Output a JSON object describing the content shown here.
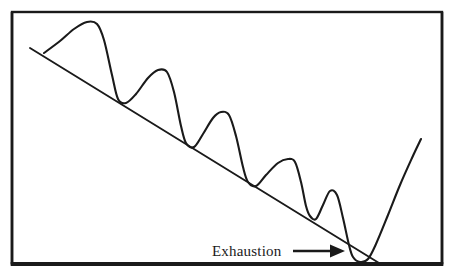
{
  "figure": {
    "background_color": "#ffffff",
    "ink_color": "#1a1a1a"
  },
  "frame": {
    "name": "chart-border-frame",
    "x": 12,
    "y": 12,
    "width": 430,
    "height": 252,
    "stroke_color": "#1a1a1a",
    "top_stroke_width": 2.4,
    "left_stroke_width": 2.6,
    "right_stroke_width": 2.6,
    "bottom_stroke_width": 4.2
  },
  "annotation": {
    "label": "Exhaustion",
    "label_x": 212,
    "label_baseline_y": 256,
    "font_size": 15,
    "arrow": {
      "name": "exhaustion-arrow",
      "shaft_start_x": 293,
      "shaft_end_x": 332,
      "y": 251,
      "head_tip_x": 345,
      "head_half_height": 6.5,
      "color": "#1a1a1a"
    }
  },
  "chart_data": {
    "type": "line",
    "subtitle": "",
    "xlabel": "",
    "ylabel": "",
    "grid": false,
    "legend_position": "none",
    "xlim": [
      12,
      442
    ],
    "ylim": [
      12,
      264
    ],
    "annotations": [
      {
        "text": "Exhaustion",
        "points_to_x": 352,
        "points_to_y": 256,
        "arrow": true,
        "arrow_direction": "right"
      }
    ],
    "series": [
      {
        "name": "price-curve",
        "type": "line",
        "stroke_color": "#1a1a1a",
        "stroke_width": 2.1,
        "smooth": true,
        "comment": "Descending series of five rounded peaks with progressively lower highs and lows, an exhaustion double-bottom, then a sharp rally.",
        "points": [
          {
            "x": 44,
            "y": 53,
            "role": "start"
          },
          {
            "x": 60,
            "y": 41,
            "role": "rise"
          },
          {
            "x": 74,
            "y": 29,
            "role": "rise"
          },
          {
            "x": 87,
            "y": 22,
            "role": "peak-1"
          },
          {
            "x": 97,
            "y": 24,
            "role": "peak-1-shoulder"
          },
          {
            "x": 104,
            "y": 40,
            "role": "decline"
          },
          {
            "x": 112,
            "y": 75,
            "role": "decline"
          },
          {
            "x": 118,
            "y": 99,
            "role": "trough-1"
          },
          {
            "x": 126,
            "y": 103,
            "role": "trough-1-base"
          },
          {
            "x": 136,
            "y": 94,
            "role": "rise"
          },
          {
            "x": 148,
            "y": 78,
            "role": "rise"
          },
          {
            "x": 158,
            "y": 70,
            "role": "peak-2"
          },
          {
            "x": 167,
            "y": 72,
            "role": "peak-2-shoulder"
          },
          {
            "x": 174,
            "y": 92,
            "role": "decline"
          },
          {
            "x": 181,
            "y": 126,
            "role": "decline"
          },
          {
            "x": 186,
            "y": 143,
            "role": "trough-2"
          },
          {
            "x": 194,
            "y": 147,
            "role": "trough-2-base"
          },
          {
            "x": 203,
            "y": 134,
            "role": "rise"
          },
          {
            "x": 213,
            "y": 118,
            "role": "rise"
          },
          {
            "x": 221,
            "y": 112,
            "role": "peak-3"
          },
          {
            "x": 229,
            "y": 115,
            "role": "peak-3-shoulder"
          },
          {
            "x": 236,
            "y": 136,
            "role": "decline"
          },
          {
            "x": 243,
            "y": 167,
            "role": "decline"
          },
          {
            "x": 248,
            "y": 182,
            "role": "trough-3"
          },
          {
            "x": 256,
            "y": 186,
            "role": "trough-3-base"
          },
          {
            "x": 266,
            "y": 175,
            "role": "rise"
          },
          {
            "x": 278,
            "y": 163,
            "role": "rise"
          },
          {
            "x": 288,
            "y": 159,
            "role": "peak-4"
          },
          {
            "x": 295,
            "y": 162,
            "role": "peak-4-shoulder"
          },
          {
            "x": 301,
            "y": 182,
            "role": "decline"
          },
          {
            "x": 306,
            "y": 206,
            "role": "decline"
          },
          {
            "x": 310,
            "y": 216,
            "role": "trough-4"
          },
          {
            "x": 316,
            "y": 219,
            "role": "trough-4-base"
          },
          {
            "x": 323,
            "y": 205,
            "role": "rise"
          },
          {
            "x": 330,
            "y": 191,
            "role": "peak-5"
          },
          {
            "x": 337,
            "y": 195,
            "role": "peak-5-shoulder"
          },
          {
            "x": 343,
            "y": 218,
            "role": "decline"
          },
          {
            "x": 349,
            "y": 245,
            "role": "decline"
          },
          {
            "x": 353,
            "y": 257,
            "role": "exhaustion-low-1"
          },
          {
            "x": 360,
            "y": 262,
            "role": "exhaustion-low-2"
          },
          {
            "x": 368,
            "y": 259,
            "role": "exhaustion-turn"
          },
          {
            "x": 376,
            "y": 244,
            "role": "rally"
          },
          {
            "x": 388,
            "y": 215,
            "role": "rally"
          },
          {
            "x": 400,
            "y": 185,
            "role": "rally"
          },
          {
            "x": 412,
            "y": 158,
            "role": "rally"
          },
          {
            "x": 421,
            "y": 139,
            "role": "rally-end"
          }
        ]
      },
      {
        "name": "downtrend-line",
        "type": "line",
        "stroke_color": "#1a1a1a",
        "stroke_width": 1.9,
        "smooth": false,
        "comment": "Straight descending resistance trendline drawn across the lower highs.",
        "points": [
          {
            "x": 30,
            "y": 48,
            "role": "trendline-start"
          },
          {
            "x": 379,
            "y": 263,
            "role": "trendline-end"
          }
        ]
      }
    ]
  }
}
